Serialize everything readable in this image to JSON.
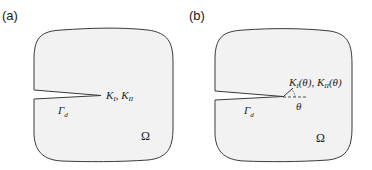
{
  "panels": [
    {
      "label": "(a)",
      "domain_symbol": "Ω",
      "crack_symbol": "Γ",
      "crack_subscript": "d",
      "sif_label": {
        "k1": "K",
        "k1_sub": "I",
        "sep": ", ",
        "k2": "K",
        "k2_sub": "II"
      }
    },
    {
      "label": "(b)",
      "domain_symbol": "Ω",
      "crack_symbol": "Γ",
      "crack_subscript": "d",
      "angle_symbol": "θ",
      "sif_label": {
        "k1": "K",
        "k1_sub": "I",
        "k1_arg": "(θ)",
        "sep": ", ",
        "k2": "K",
        "k2_sub": "II",
        "k2_arg": "(θ)"
      }
    }
  ],
  "colors": {
    "fill": "#f2f2f2",
    "stroke": "#3a3a3a"
  }
}
